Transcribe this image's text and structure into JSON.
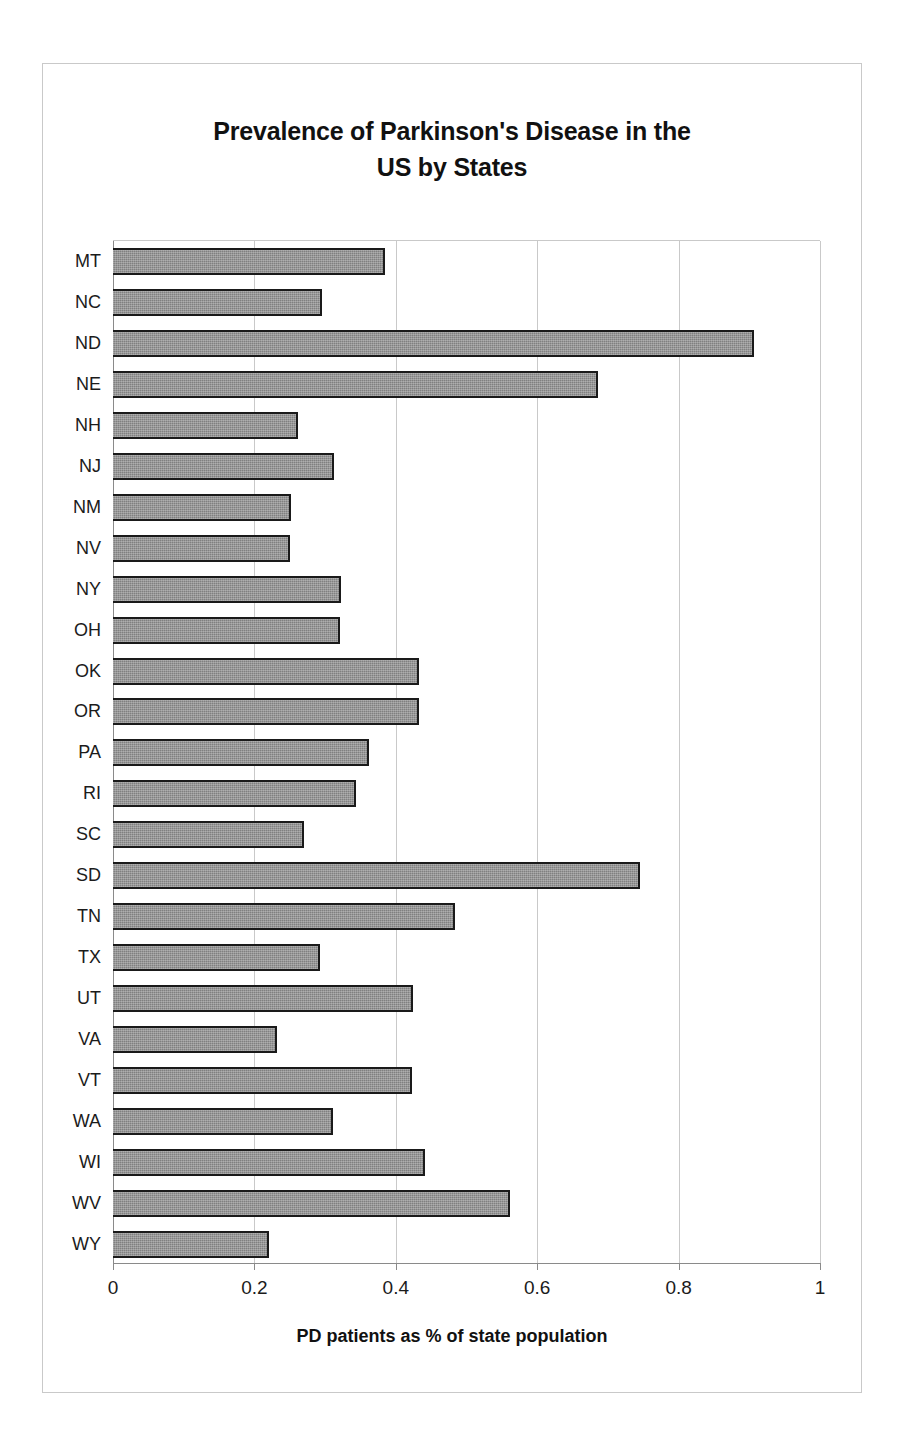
{
  "chart_data": {
    "type": "bar",
    "orientation": "horizontal",
    "title": "Prevalence of Parkinson's Disease in the US by States",
    "title_lines": [
      "Prevalence of Parkinson's Disease in the",
      "US by States"
    ],
    "xlabel": "PD patients as % of state population",
    "ylabel": "",
    "xlim": [
      0,
      1
    ],
    "xticks": [
      0,
      0.2,
      0.4,
      0.6,
      0.8,
      1
    ],
    "xtick_labels": [
      "0",
      "0.2",
      "0.4",
      "0.6",
      "0.8",
      "1"
    ],
    "grid": "vertical",
    "legend": "none",
    "bar_color": "#808080",
    "bar_border_color": "#1a1a1a",
    "categories": [
      "MT",
      "NC",
      "ND",
      "NE",
      "NH",
      "NJ",
      "NM",
      "NV",
      "NY",
      "OH",
      "OK",
      "OR",
      "PA",
      "RI",
      "SC",
      "SD",
      "TN",
      "TX",
      "UT",
      "VA",
      "VT",
      "WA",
      "WI",
      "WV",
      "WY"
    ],
    "values": [
      0.385,
      0.295,
      0.906,
      0.686,
      0.262,
      0.313,
      0.252,
      0.251,
      0.322,
      0.321,
      0.433,
      0.433,
      0.362,
      0.343,
      0.27,
      0.745,
      0.484,
      0.293,
      0.424,
      0.232,
      0.423,
      0.311,
      0.442,
      0.562,
      0.22
    ],
    "points": [
      {
        "state": "MT",
        "value": 0.385
      },
      {
        "state": "NC",
        "value": 0.295
      },
      {
        "state": "ND",
        "value": 0.906
      },
      {
        "state": "NE",
        "value": 0.686
      },
      {
        "state": "NH",
        "value": 0.262
      },
      {
        "state": "NJ",
        "value": 0.313
      },
      {
        "state": "NM",
        "value": 0.252
      },
      {
        "state": "NV",
        "value": 0.251
      },
      {
        "state": "NY",
        "value": 0.322
      },
      {
        "state": "OH",
        "value": 0.321
      },
      {
        "state": "OK",
        "value": 0.433
      },
      {
        "state": "OR",
        "value": 0.433
      },
      {
        "state": "PA",
        "value": 0.362
      },
      {
        "state": "RI",
        "value": 0.343
      },
      {
        "state": "SC",
        "value": 0.27
      },
      {
        "state": "SD",
        "value": 0.745
      },
      {
        "state": "TN",
        "value": 0.484
      },
      {
        "state": "TX",
        "value": 0.293
      },
      {
        "state": "UT",
        "value": 0.424
      },
      {
        "state": "VA",
        "value": 0.232
      },
      {
        "state": "VT",
        "value": 0.423
      },
      {
        "state": "WA",
        "value": 0.311
      },
      {
        "state": "WI",
        "value": 0.442
      },
      {
        "state": "WV",
        "value": 0.562
      },
      {
        "state": "WY",
        "value": 0.22
      }
    ]
  }
}
